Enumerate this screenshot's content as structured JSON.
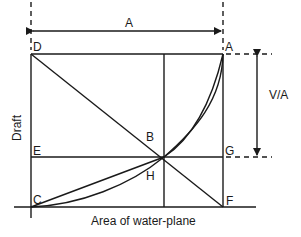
{
  "diagram": {
    "type": "waterplane-area-curve",
    "colors": {
      "line": "#1a1a1a",
      "background": "#ffffff"
    },
    "points": {
      "A": "A",
      "B": "B",
      "C": "C",
      "D": "D",
      "E": "E",
      "F": "F",
      "G": "G",
      "H": "H"
    },
    "dimensions": {
      "width_label": "A",
      "height_label": "V/A"
    },
    "axes": {
      "x_label": "Area of water-plane",
      "y_label": "Draft"
    }
  }
}
